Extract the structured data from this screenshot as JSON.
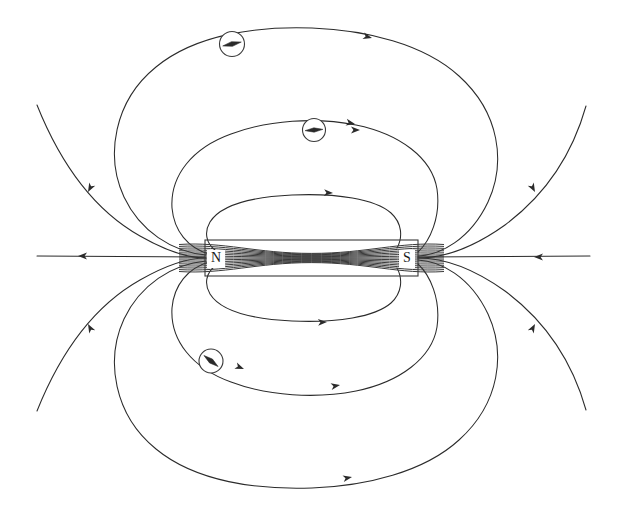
{
  "figure": {
    "title": "Magnetic field lines of a bar magnet",
    "type": "physics-diagram",
    "background_color": "#ffffff",
    "line_color": "#2b2b2b",
    "width": 621,
    "height": 510
  },
  "magnet": {
    "name": "bar-magnet",
    "north_label": "N",
    "south_label": "S",
    "x": 205,
    "y": 240,
    "width": 213,
    "height": 36,
    "north_label_x": 216,
    "north_label_y": 259,
    "south_label_x": 407,
    "south_label_y": 259,
    "stroke_color": "#3a3a3a"
  },
  "compasses": [
    {
      "name": "compass-top-outer",
      "cx": 232,
      "cy": 44,
      "r": 12.5,
      "needle_angle_deg": -12,
      "needle_length": 9.5,
      "needle_half_width": 2.4
    },
    {
      "name": "compass-top-inner",
      "cx": 314,
      "cy": 130,
      "r": 11.5,
      "needle_angle_deg": -4,
      "needle_length": 9.0,
      "needle_half_width": 2.2
    },
    {
      "name": "compass-bottom",
      "cx": 211,
      "cy": 361,
      "r": 12.0,
      "needle_angle_deg": 38,
      "needle_length": 9.0,
      "needle_half_width": 2.4
    }
  ],
  "chart_data": {
    "type": "diagram",
    "title": "Magnetic field lines of a bar magnet",
    "field_lines_outside": 4,
    "field_lines_inside_magnet": 15,
    "axis_lines": 2,
    "arrow_count": 14,
    "symmetry": "mirror about horizontal axis y=258"
  },
  "field_lines": {
    "axis_left": {
      "name": "axis-line-left",
      "d": "M 37 256 L 205 257"
    },
    "axis_right": {
      "name": "axis-line-right",
      "d": "M 418 257 L 590 256"
    },
    "upper": [
      {
        "name": "fieldline-upper-1",
        "d": "M 37 105 C 55 150 85 205 140 236 C 175 256 196 258 206 258"
      },
      {
        "name": "fieldline-upper-1b",
        "d": "M 418 258 C 440 258 470 250 505 225 C 552 190 575 145 586 106"
      },
      {
        "name": "fieldline-upper-outer-loop",
        "d": "M 206 255 C 172 252 140 231 124 197 C 105 156 114 101 156 67 C 196 34 258 26 312 28 C 366 30 424 44 459 76 C 500 113 506 163 488 202 C 470 240 440 255 418 256"
      },
      {
        "name": "fieldline-upper-mid-loop",
        "d": "M 209 254 C 188 248 174 231 172 208 C 170 176 192 148 231 134 C 268 120 316 117 356 125 C 400 134 432 158 437 189 C 441 217 430 241 418 252"
      },
      {
        "name": "fieldline-upper-inner-loop",
        "d": "M 215 250 C 206 243 204 232 210 222 C 220 206 250 197 292 195 C 337 193 375 199 391 213 C 402 223 403 237 397 248"
      }
    ],
    "lower": [
      {
        "name": "fieldline-lower-1",
        "d": "M 37 411 C 55 366 85 311 140 280 C 175 260 196 258 206 258"
      },
      {
        "name": "fieldline-lower-1b",
        "d": "M 418 258 C 440 258 470 266 505 291 C 552 326 575 371 586 410"
      },
      {
        "name": "fieldline-lower-outer-loop",
        "d": "M 206 261 C 172 264 140 285 124 319 C 105 360 114 415 156 449 C 196 482 258 490 312 488 C 366 486 424 472 459 440 C 500 403 506 353 488 314 C 470 276 440 261 418 260"
      },
      {
        "name": "fieldline-lower-mid-loop",
        "d": "M 209 262 C 188 268 174 285 172 308 C 170 340 192 368 231 382 C 268 396 316 399 356 391 C 400 382 432 358 437 327 C 441 299 430 275 418 264"
      },
      {
        "name": "fieldline-lower-inner-loop",
        "d": "M 215 266 C 206 273 204 284 210 294 C 220 310 250 319 292 321 C 337 323 375 317 391 303 C 402 293 403 279 397 268"
      }
    ],
    "interior_count": 15
  },
  "arrows": [
    {
      "name": "arrow-axis-left",
      "x": 78,
      "y": 256,
      "angle": 180
    },
    {
      "name": "arrow-axis-right",
      "x": 534,
      "y": 257,
      "angle": 180
    },
    {
      "name": "arrow-upper-left-outer",
      "x": 88,
      "y": 192,
      "angle": 118
    },
    {
      "name": "arrow-upper-right-outer",
      "x": 535,
      "y": 192,
      "angle": 62
    },
    {
      "name": "arrow-upper-outer-top",
      "x": 372,
      "y": 38,
      "angle": 14
    },
    {
      "name": "arrow-upper-mid-top",
      "x": 355,
      "y": 124,
      "angle": 12
    },
    {
      "name": "arrow-upper-inner-top",
      "x": 333,
      "y": 193,
      "angle": 3
    },
    {
      "name": "arrow-upper-compass",
      "x": 360,
      "y": 130,
      "angle": 0
    },
    {
      "name": "arrow-lower-left-outer",
      "x": 88,
      "y": 324,
      "angle": 242
    },
    {
      "name": "arrow-lower-right-outer",
      "x": 535,
      "y": 324,
      "angle": 298
    },
    {
      "name": "arrow-lower-outer-bot",
      "x": 352,
      "y": 477,
      "angle": 349
    },
    {
      "name": "arrow-lower-mid-bot",
      "x": 340,
      "y": 385,
      "angle": 350
    },
    {
      "name": "arrow-lower-inner-bot",
      "x": 327,
      "y": 322,
      "angle": 357
    },
    {
      "name": "arrow-lower-compass",
      "x": 244,
      "y": 369,
      "angle": 22
    }
  ]
}
